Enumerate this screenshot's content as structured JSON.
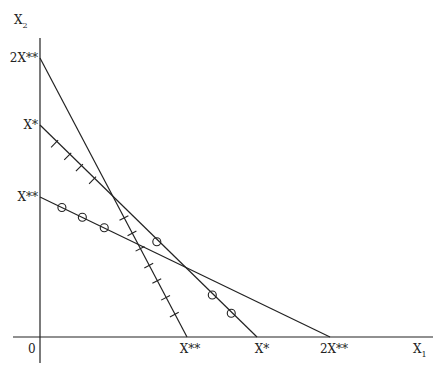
{
  "diagram": {
    "type": "linear-constraint-diagram",
    "axes": {
      "x_label": "X",
      "x_subscript": "1",
      "y_label": "X",
      "y_subscript": "2",
      "origin_label": "0"
    },
    "values": {
      "X**": 1,
      "X*": 1.48,
      "2X**": 2
    },
    "y_ticks": [
      {
        "label": "2X**",
        "value": 2
      },
      {
        "label": "X*",
        "value": 1.48
      },
      {
        "label": "X**",
        "value": 1
      }
    ],
    "x_ticks": [
      {
        "label": "X**",
        "value": 1
      },
      {
        "label": "X*",
        "value": 1.48
      },
      {
        "label": "2X**",
        "value": 2
      }
    ],
    "lines": [
      {
        "name": "line-2xss-to-xss",
        "y_intercept": 2,
        "x_intercept": 1,
        "marker": "tick",
        "marked_segment": "below-intersection-with-Xstar-line"
      },
      {
        "name": "line-xs-to-xs",
        "y_intercept": 1.48,
        "x_intercept": 1.48,
        "marker_upper": "tick",
        "marker_lower": "circle"
      },
      {
        "name": "line-xss-to-2xss",
        "y_intercept": 1,
        "x_intercept": 2,
        "marker": "circle",
        "marked_segment": "left-of-intersection-with-Xstar-line"
      }
    ],
    "markers": {
      "ticks_on_xs_line_x": [
        0.1,
        0.19,
        0.27,
        0.36
      ],
      "ticks_on_2xss_line_y": [
        0.85,
        0.74,
        0.63,
        0.51,
        0.4,
        0.28,
        0.16
      ],
      "circles_on_xss_line_x": [
        0.15,
        0.29,
        0.44
      ],
      "circles_on_xs_line_x": [
        0.8,
        1.18,
        1.31
      ]
    }
  }
}
